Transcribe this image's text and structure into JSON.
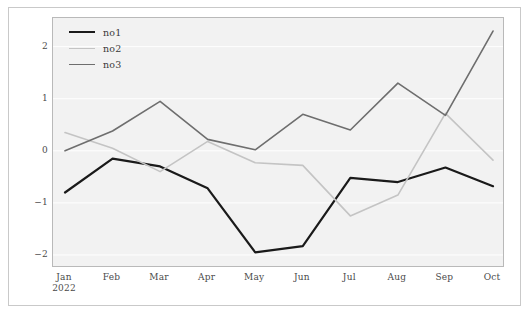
{
  "chart_data": {
    "type": "line",
    "title": "",
    "xlabel": "",
    "ylabel": "",
    "x": [
      "Jan\n2022",
      "Feb",
      "Mar",
      "Apr",
      "May",
      "Jun",
      "Jul",
      "Aug",
      "Sep",
      "Oct"
    ],
    "categories": [
      "Jan 2022",
      "Feb",
      "Mar",
      "Apr",
      "May",
      "Jun",
      "Jul",
      "Aug",
      "Sep",
      "Oct"
    ],
    "series": [
      {
        "name": "no1",
        "color": "#1a1a1a",
        "width": 2.2,
        "values": [
          -0.8,
          -0.15,
          -0.3,
          -0.72,
          -1.95,
          -1.83,
          -0.52,
          -0.6,
          -0.32,
          -0.68
        ]
      },
      {
        "name": "no2",
        "color": "#c4c4c4",
        "width": 1.6,
        "values": [
          0.35,
          0.05,
          -0.4,
          0.18,
          -0.23,
          -0.28,
          -1.25,
          -0.85,
          0.72,
          -0.18
        ]
      },
      {
        "name": "no3",
        "color": "#6e6e6e",
        "width": 1.6,
        "values": [
          0.0,
          0.38,
          0.95,
          0.22,
          0.02,
          0.7,
          0.4,
          1.3,
          0.68,
          2.3
        ]
      }
    ],
    "ylim": [
      -2.25,
      2.55
    ],
    "yticks": [
      2,
      1,
      0,
      -1,
      -2
    ],
    "ytick_labels": [
      "2",
      "1",
      "0",
      "−1",
      "−2"
    ],
    "grid": true,
    "legend_position": "top-left",
    "panel_background": "#f2f2f2",
    "grid_color": "#ffffff",
    "frame_color": "#c9c9c9"
  },
  "axis": {
    "y_labels": [
      "2",
      "1",
      "0",
      "−1",
      "−2"
    ],
    "x_labels": [
      {
        "main": "Jan",
        "sub": "2022"
      },
      {
        "main": "Feb",
        "sub": ""
      },
      {
        "main": "Mar",
        "sub": ""
      },
      {
        "main": "Apr",
        "sub": ""
      },
      {
        "main": "May",
        "sub": ""
      },
      {
        "main": "Jun",
        "sub": ""
      },
      {
        "main": "Jul",
        "sub": ""
      },
      {
        "main": "Aug",
        "sub": ""
      },
      {
        "main": "Sep",
        "sub": ""
      },
      {
        "main": "Oct",
        "sub": ""
      }
    ]
  },
  "legend": {
    "items": [
      {
        "label": "no1",
        "color": "#1a1a1a"
      },
      {
        "label": "no2",
        "color": "#c4c4c4"
      },
      {
        "label": "no3",
        "color": "#6e6e6e"
      }
    ]
  }
}
